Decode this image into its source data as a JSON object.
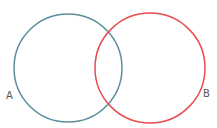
{
  "diagram": {
    "type": "venn",
    "sets": [
      {
        "label": "A",
        "color": "#5b8f9e",
        "cx": 68,
        "cy": 68,
        "r": 54,
        "label_x": 6,
        "label_y": 99
      },
      {
        "label": "B",
        "color": "#e84c4c",
        "cx": 150,
        "cy": 68,
        "r": 55,
        "label_x": 203,
        "label_y": 97
      }
    ],
    "background": "#ffffff"
  }
}
